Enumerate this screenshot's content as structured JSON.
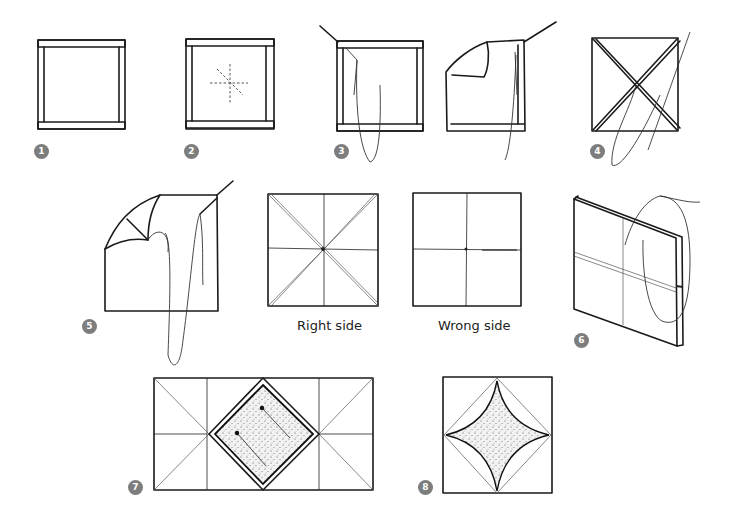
{
  "figure": {
    "steps": [
      {
        "number": "1",
        "description": "square frame"
      },
      {
        "number": "2",
        "description": "frame with dashed center guide lines"
      },
      {
        "number": "3",
        "description": "threading needle through corner, folding fabric"
      },
      {
        "number": "4",
        "description": "diagonal stitched X across square"
      },
      {
        "number": "5",
        "description": "folding corner and stitching"
      },
      {
        "number": "6",
        "description": "folded piece with thread"
      },
      {
        "number": "7",
        "description": "rectangle with pinned shaded diamond"
      },
      {
        "number": "8",
        "description": "square with curved shaded diamond"
      }
    ],
    "captions": {
      "right_side": "Right side",
      "wrong_side": "Wrong side"
    },
    "colors": {
      "ink": "#1a1a1a",
      "badge": "#7d7d7d",
      "background": "#ffffff"
    }
  }
}
